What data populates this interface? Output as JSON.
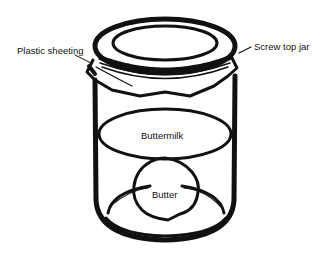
{
  "diagram": {
    "labels": {
      "plastic_sheeting": "Plastic sheeting",
      "screw_top_jar": "Screw top jar",
      "buttermilk": "Buttermilk",
      "butter": "Butter"
    },
    "colors": {
      "ink": "#111111",
      "background": "#ffffff"
    }
  }
}
